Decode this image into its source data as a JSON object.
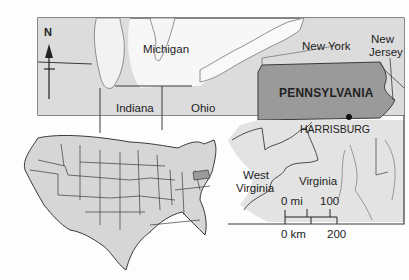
{
  "map": {
    "title": "Pennsylvania locator map",
    "highlighted_state": "PENNSYLVANIA",
    "capital_label": "HARRISBURG",
    "state_labels": {
      "michigan": "Michigan",
      "indiana": "Indiana",
      "ohio": "Ohio",
      "new_york": "New York",
      "new_jersey_line1": "New",
      "new_jersey_line2": "Jersey",
      "west_virginia_line1": "West",
      "west_virginia_line2": "Virginia",
      "virginia": "Virginia"
    },
    "compass": {
      "label": "N"
    },
    "scale": {
      "mi_zero": "0 mi",
      "mi_max": "100",
      "km_zero": "0 km",
      "km_max": "200"
    },
    "colors": {
      "land": "#dcdcdc",
      "highlight": "#9a9a9a",
      "water": "#f7f7f7",
      "border": "#3a3a3a",
      "inset_land": "#d6d6d6"
    },
    "inset": {
      "description": "Contiguous United States with Pennsylvania highlighted"
    }
  }
}
